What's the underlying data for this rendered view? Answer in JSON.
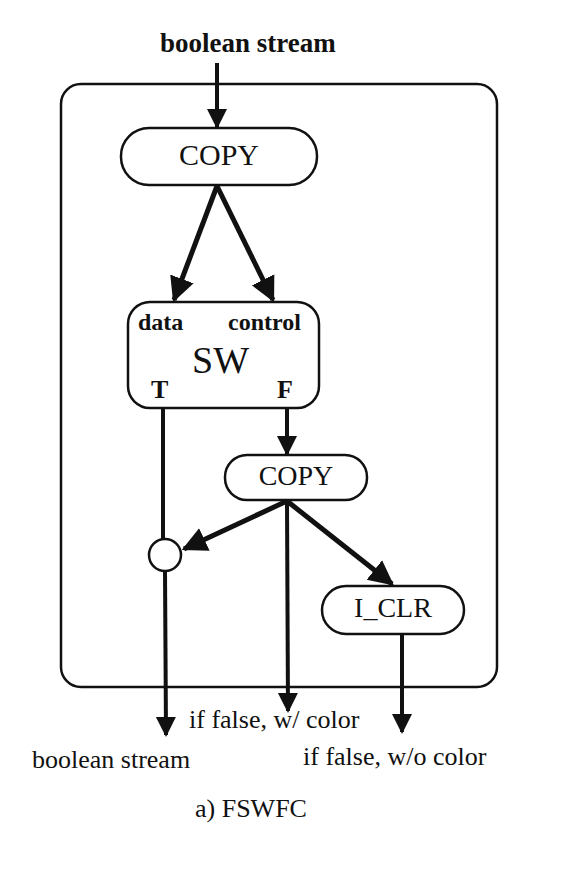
{
  "figure": {
    "caption": "a) FSWFC",
    "input_label": "boolean stream",
    "outputs": {
      "true_output": "boolean stream",
      "false_with_color": "if false, w/ color",
      "false_without_color": "if false, w/o color"
    }
  },
  "nodes": {
    "copy_top": {
      "label": "COPY"
    },
    "switch": {
      "label": "SW",
      "port_data": "data",
      "port_control": "control",
      "port_true": "T",
      "port_false": "F"
    },
    "copy_bottom": {
      "label": "COPY"
    },
    "merge": {
      "label": ""
    },
    "iclr": {
      "label": "I_CLR"
    }
  },
  "edges": [
    {
      "from": "input",
      "to": "copy_top"
    },
    {
      "from": "copy_top",
      "to": "switch.data"
    },
    {
      "from": "copy_top",
      "to": "switch.control"
    },
    {
      "from": "switch.F",
      "to": "copy_bottom"
    },
    {
      "from": "switch.T",
      "to": "merge"
    },
    {
      "from": "copy_bottom",
      "to": "merge"
    },
    {
      "from": "copy_bottom",
      "to": "output.false_with_color"
    },
    {
      "from": "copy_bottom",
      "to": "iclr"
    },
    {
      "from": "merge",
      "to": "output.true_output"
    },
    {
      "from": "iclr",
      "to": "output.false_without_color"
    }
  ]
}
